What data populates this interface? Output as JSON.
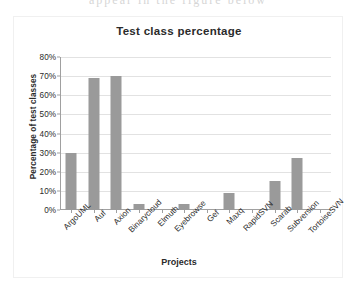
{
  "bleed_text": "appear in the figure below",
  "chart_data": {
    "type": "bar",
    "title": "Test class percentage",
    "xlabel": "Projects",
    "ylabel": "Percentage of test classes",
    "categories": [
      "ArgoUML",
      "Auf",
      "Axion",
      "Binarycloud",
      "Elmuth",
      "Eyebrowse",
      "Gef",
      "Maxq",
      "RapidSVN",
      "Scarab",
      "Subversion",
      "TortoiseSVN"
    ],
    "values": [
      30,
      69,
      70,
      3,
      0,
      3,
      0,
      9,
      0,
      15,
      27,
      0
    ],
    "ylim": [
      0,
      80
    ],
    "ytick_values": [
      0,
      10,
      20,
      30,
      40,
      50,
      60,
      70,
      80
    ],
    "ytick_labels": [
      "0%",
      "10%",
      "20%",
      "30%",
      "40%",
      "50%",
      "60%",
      "70%",
      "80%"
    ],
    "grid": true,
    "legend": false,
    "bar_color": "#9a9a9a",
    "grid_color": "#e2e2e2",
    "axis_color": "#a0a0a0",
    "text_color": "#2b2b2b",
    "background": "#ffffff"
  }
}
